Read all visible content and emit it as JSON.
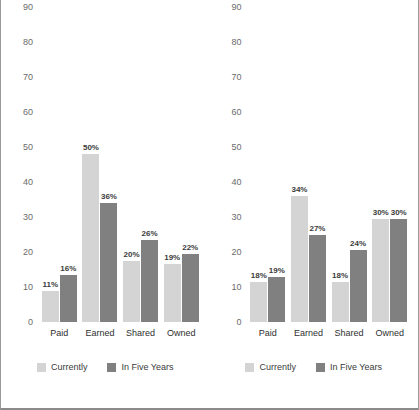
{
  "chart_data": [
    {
      "type": "bar",
      "panel": "left",
      "title": "",
      "xlabel": "",
      "ylabel": "",
      "ylim": [
        0,
        90
      ],
      "yticks": [
        0,
        10,
        20,
        30,
        40,
        50,
        60,
        70,
        80,
        90
      ],
      "grid": false,
      "legend_position": "bottom",
      "categories": [
        "Paid",
        "Earned",
        "Shared",
        "Owned"
      ],
      "series": [
        {
          "name": "Currently",
          "color": "#d4d4d4",
          "values": [
            9,
            48,
            17.5,
            16.5
          ],
          "labels": [
            "11%",
            "50%",
            "20%",
            "19%"
          ]
        },
        {
          "name": "In Five Years",
          "color": "#808080",
          "values": [
            13.5,
            34,
            23.5,
            19.5
          ],
          "labels": [
            "16%",
            "36%",
            "26%",
            "22%"
          ]
        }
      ]
    },
    {
      "type": "bar",
      "panel": "right",
      "title": "",
      "xlabel": "",
      "ylabel": "",
      "ylim": [
        0,
        90
      ],
      "yticks": [
        0,
        10,
        20,
        30,
        40,
        50,
        60,
        70,
        80,
        90
      ],
      "grid": false,
      "legend_position": "bottom",
      "categories": [
        "Paid",
        "Earned",
        "Shared",
        "Owned"
      ],
      "series": [
        {
          "name": "Currently",
          "color": "#d4d4d4",
          "values": [
            11.5,
            36,
            11.5,
            29.5
          ],
          "labels": [
            "18%",
            "34%",
            "18%",
            "30%"
          ]
        },
        {
          "name": "In Five Years",
          "color": "#808080",
          "values": [
            13,
            25,
            20.5,
            29.5
          ],
          "labels": [
            "19%",
            "27%",
            "24%",
            "30%"
          ]
        }
      ]
    }
  ]
}
